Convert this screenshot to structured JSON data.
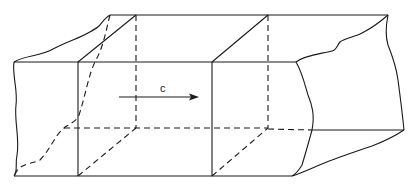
{
  "diagram": {
    "title": "",
    "arrow_label": "c",
    "colors": {
      "line": "#1a1a1a",
      "background": "#ffffff"
    },
    "elements": [
      {
        "name": "front-left-cross-section",
        "style": "solid"
      },
      {
        "name": "front-right-cross-section",
        "style": "solid"
      },
      {
        "name": "back-left-cross-section",
        "style": "dashed"
      },
      {
        "name": "back-right-cross-section",
        "style": "dashed"
      },
      {
        "name": "left-torn-edge",
        "style": "solid/dashed"
      },
      {
        "name": "right-torn-edge",
        "style": "solid"
      },
      {
        "name": "velocity-arrow",
        "label": "c",
        "direction": "right"
      }
    ]
  }
}
